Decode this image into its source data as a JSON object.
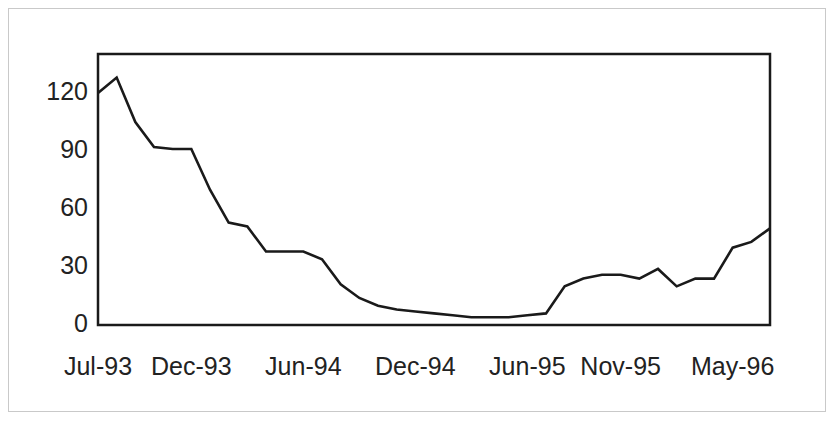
{
  "chart_data": {
    "type": "line",
    "title": "",
    "subtitle": "",
    "xlabel": "",
    "ylabel": "",
    "ylim": [
      0,
      135
    ],
    "yticks": [
      0,
      30,
      60,
      90,
      120
    ],
    "ytick_labels": [
      "0",
      "30",
      "60",
      "90",
      "120"
    ],
    "grid": false,
    "legend": null,
    "legend_position": "none",
    "line_color": "#1a1a1a",
    "line_width": 2,
    "background_color": "#ffffff",
    "plot_border_color": "#1a1a1a",
    "outer_border_color": "#c9c9c9",
    "x": [
      "Jul-93",
      "Aug-93",
      "Sep-93",
      "Oct-93",
      "Nov-93",
      "Dec-93",
      "Jan-94",
      "Feb-94",
      "Mar-94",
      "Apr-94",
      "May-94",
      "Jun-94",
      "Jul-94",
      "Aug-94",
      "Sep-94",
      "Oct-94",
      "Nov-94",
      "Dec-94",
      "Jan-95",
      "Feb-95",
      "Mar-95",
      "Apr-95",
      "May-95",
      "Jun-95",
      "Jul-95",
      "Aug-95",
      "Sep-95",
      "Oct-95",
      "Nov-95",
      "Dec-95",
      "Jan-96",
      "Feb-96",
      "Mar-96",
      "Apr-96",
      "May-96",
      "Jun-96",
      "Jul-96"
    ],
    "xtick_labels": [
      "Jul-93",
      "Dec-93",
      "Jun-94",
      "Dec-94",
      "Jun-95",
      "Nov-95",
      "May-96"
    ],
    "xtick_indices": [
      0,
      5,
      11,
      17,
      23,
      28,
      34
    ],
    "values": [
      120,
      128,
      105,
      92,
      91,
      91,
      70,
      53,
      51,
      38,
      38,
      38,
      34,
      21,
      14,
      10,
      8,
      7,
      6,
      5,
      4,
      4,
      4,
      5,
      6,
      20,
      24,
      26,
      26,
      24,
      29,
      20,
      24,
      24,
      40,
      43,
      50
    ]
  }
}
